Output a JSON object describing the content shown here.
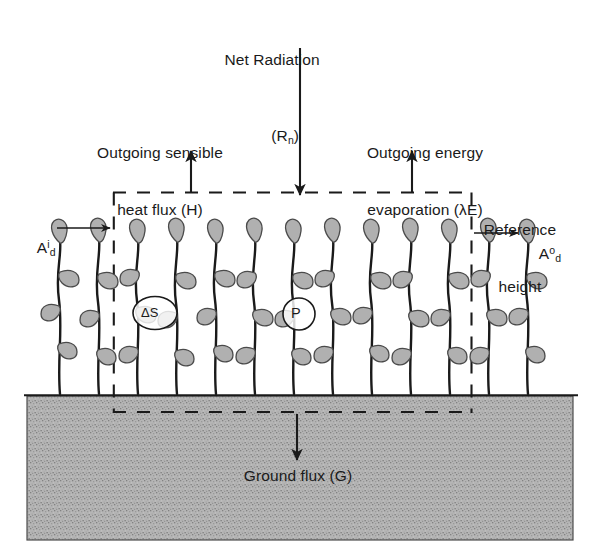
{
  "diagram": {
    "colors": {
      "ink": "#1a1a1a",
      "soil_fill": "#b3b3b3",
      "soil_speckle": "#8a8a8a",
      "leaf_fill": "#b0b0b0",
      "leaf_stroke": "#4a4a4a",
      "stem": "#1a1a1a",
      "background": "#ffffff"
    },
    "labels": {
      "net_radiation": {
        "line1": "Net Radiation",
        "base": "(R",
        "sub": "n",
        "close": ")"
      },
      "sensible_heat": {
        "line1": "Outgoing sensible",
        "line2": "heat flux (H)"
      },
      "evaporation": {
        "line1": "Outgoing energy",
        "line2": "evaporation (λE)"
      },
      "reference_height": {
        "line1": "Reference",
        "line2": "height"
      },
      "advection_in": {
        "base": "A",
        "sup": "i",
        "sub": "d"
      },
      "advection_out": {
        "base": "A",
        "sup": "o",
        "sub": "d"
      },
      "ground_flux": {
        "text": "Ground flux (G)"
      },
      "storage": {
        "text": "ΔS"
      },
      "photosynthesis": {
        "text": "P"
      }
    },
    "arrows": [
      {
        "name": "net-radiation-arrow",
        "direction": "down",
        "x": 300,
        "from_y": 48,
        "to_y": 193
      },
      {
        "name": "sensible-heat-arrow",
        "direction": "up",
        "x": 191,
        "from_y": 193,
        "to_y": 152
      },
      {
        "name": "evaporation-arrow",
        "direction": "up",
        "x": 412,
        "from_y": 193,
        "to_y": 152
      },
      {
        "name": "advection-in-arrow",
        "direction": "right",
        "y": 228,
        "from_x": 58,
        "to_x": 110
      },
      {
        "name": "advection-out-arrow",
        "direction": "right",
        "y": 233,
        "from_x": 473,
        "to_x": 518
      },
      {
        "name": "ground-flux-arrow",
        "direction": "down",
        "x": 297,
        "from_y": 415,
        "to_y": 460
      }
    ],
    "control_volume": {
      "left": 113,
      "top": 192,
      "right": 472,
      "bottom": 413
    },
    "soil": {
      "left": 27,
      "top": 396,
      "right": 573,
      "bottom": 540
    },
    "canopy": {
      "plant_count": 13,
      "first_x": 60,
      "spacing": 39,
      "top_y": 238,
      "base_y": 394
    }
  }
}
